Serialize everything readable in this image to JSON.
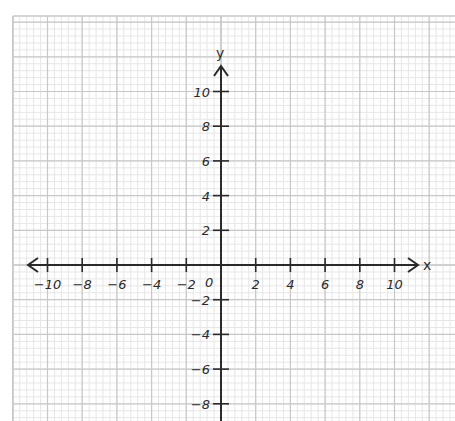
{
  "graph": {
    "title": "",
    "x_axis_label": "x",
    "y_axis_label": "y",
    "origin_label": "0",
    "x_range": [
      -10,
      10
    ],
    "y_range_visible": [
      -8,
      10
    ],
    "tick_step": 2,
    "x_tick_labels": [
      "-10",
      "-8",
      "-6",
      "-4",
      "-2",
      "2",
      "4",
      "6",
      "8",
      "10"
    ],
    "y_tick_labels": [
      "10",
      "8",
      "6",
      "4",
      "2",
      "-2",
      "-4",
      "-6",
      "-8"
    ],
    "grid": {
      "major_step_units": 2,
      "minor_subdivisions": 5,
      "major_color": "#c8c8c8",
      "minor_color": "#e6e6e6"
    },
    "colors": {
      "axis": "#2a2a2a",
      "background": "#ffffff"
    }
  }
}
